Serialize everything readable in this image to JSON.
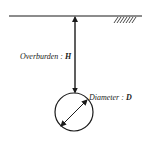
{
  "diagram": {
    "overburden_label": "Overburden",
    "overburden_symbol": "H",
    "diameter_label": "Diameter",
    "diameter_symbol": "D",
    "separator": " : ",
    "line_color": "#1a1a1a"
  }
}
